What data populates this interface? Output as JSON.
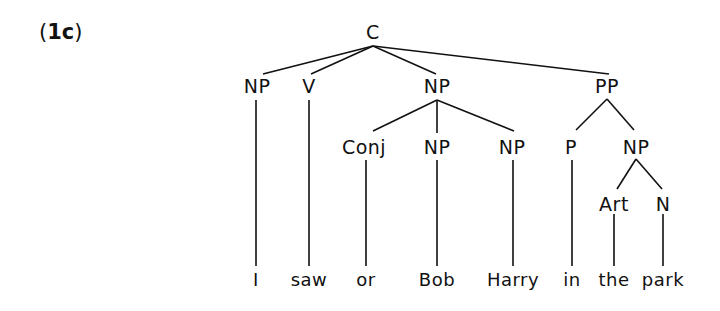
{
  "example": {
    "open": "(",
    "number": "1c",
    "close": ")"
  },
  "tree": {
    "root": {
      "label": "C",
      "x": 373,
      "y": 22
    },
    "nodes": [
      {
        "id": "np1",
        "label": "NP",
        "x": 257,
        "y": 76
      },
      {
        "id": "v",
        "label": "V",
        "x": 309,
        "y": 76
      },
      {
        "id": "np2",
        "label": "NP",
        "x": 437,
        "y": 76
      },
      {
        "id": "pp",
        "label": "PP",
        "x": 607,
        "y": 76
      },
      {
        "id": "conj",
        "label": "Conj",
        "x": 364,
        "y": 137
      },
      {
        "id": "np3",
        "label": "NP",
        "x": 437,
        "y": 137
      },
      {
        "id": "np4",
        "label": "NP",
        "x": 512,
        "y": 137
      },
      {
        "id": "p",
        "label": "P",
        "x": 571,
        "y": 137
      },
      {
        "id": "np5",
        "label": "NP",
        "x": 636,
        "y": 137
      },
      {
        "id": "art",
        "label": "Art",
        "x": 614,
        "y": 194
      },
      {
        "id": "n",
        "label": "N",
        "x": 663,
        "y": 194
      }
    ],
    "words": [
      {
        "text": "I",
        "x": 256
      },
      {
        "text": "saw",
        "x": 309
      },
      {
        "text": "or",
        "x": 366
      },
      {
        "text": "Bob",
        "x": 437
      },
      {
        "text": "Harry",
        "x": 513
      },
      {
        "text": "in",
        "x": 572
      },
      {
        "text": "the",
        "x": 614
      },
      {
        "text": "park",
        "x": 663
      }
    ],
    "words_y": 270,
    "edges": [
      [
        373,
        46,
        263,
        74
      ],
      [
        373,
        46,
        311,
        74
      ],
      [
        373,
        46,
        436,
        74
      ],
      [
        373,
        46,
        609,
        74
      ],
      [
        437,
        100,
        373,
        131
      ],
      [
        437,
        100,
        437,
        133
      ],
      [
        437,
        100,
        514,
        131
      ],
      [
        607,
        99,
        576,
        130
      ],
      [
        607,
        99,
        634,
        130
      ],
      [
        636,
        159,
        617,
        189
      ],
      [
        636,
        159,
        662,
        189
      ],
      [
        256,
        100,
        256,
        266
      ],
      [
        309,
        100,
        309,
        266
      ],
      [
        366,
        160,
        366,
        266
      ],
      [
        437,
        160,
        437,
        266
      ],
      [
        513,
        160,
        513,
        266
      ],
      [
        572,
        160,
        572,
        266
      ],
      [
        614,
        214,
        614,
        266
      ],
      [
        663,
        214,
        663,
        266
      ]
    ]
  }
}
